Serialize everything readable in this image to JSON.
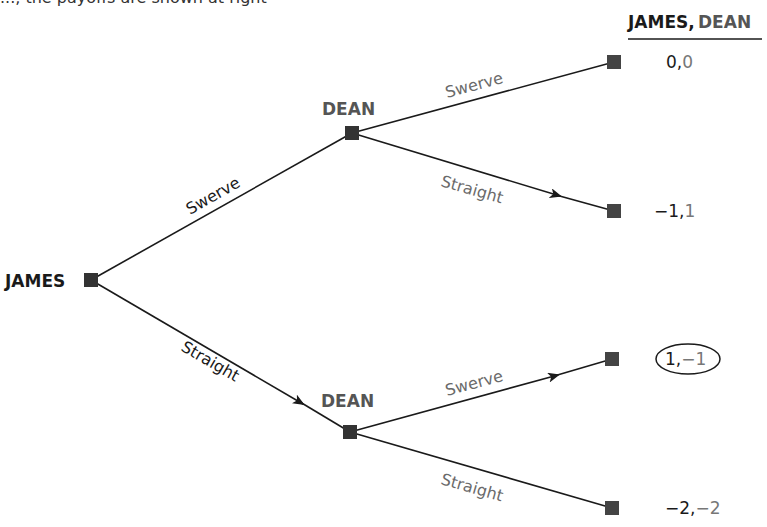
{
  "header": {
    "cut_off_text": "..., the payoffs are shown at right",
    "payoff_header_player1": "JAMES,",
    "payoff_header_player2": "DEAN"
  },
  "colors": {
    "player1": "#1a1a1a",
    "player2": "#555555",
    "action_text": "#6a6a6a",
    "line": "#1a1a1a",
    "node": "#333333"
  },
  "tree": {
    "root": {
      "player": "JAMES"
    },
    "decision_nodes": [
      {
        "id": "dean_upper",
        "player": "DEAN",
        "incoming_action": "Swerve"
      },
      {
        "id": "dean_lower",
        "player": "DEAN",
        "incoming_action": "Straight"
      }
    ],
    "root_actions": [
      "Swerve",
      "Straight"
    ],
    "dean_actions": [
      "Swerve",
      "Straight"
    ],
    "terminals": [
      {
        "path": "Swerve-Swerve",
        "action": "Swerve",
        "james": "0",
        "dean": "0",
        "circled": false
      },
      {
        "path": "Swerve-Straight",
        "action": "Straight",
        "james": "−1",
        "dean": "1",
        "circled": false
      },
      {
        "path": "Straight-Swerve",
        "action": "Swerve",
        "james": "1",
        "dean": "−1",
        "circled": true
      },
      {
        "path": "Straight-Straight",
        "action": "Straight",
        "james": "−2",
        "dean": "−2",
        "circled": false
      }
    ],
    "equilibrium_arrows": [
      "James:Straight",
      "Dean(after Swerve):Straight",
      "Dean(after Straight):Swerve"
    ]
  }
}
